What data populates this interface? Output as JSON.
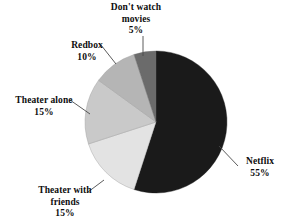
{
  "chart_data": {
    "type": "pie",
    "title": "",
    "subtitle": "",
    "xlabel": "",
    "ylabel": "",
    "legend_position": "none",
    "grid": false,
    "total": 100,
    "units": "%",
    "categories": [
      "Netflix",
      "Theater with friends",
      "Theater alone",
      "Redbox",
      "Don't watch movies"
    ],
    "values": [
      55,
      15,
      15,
      10,
      5
    ],
    "slices": [
      {
        "label": "Netflix",
        "value": 55,
        "value_text": "55%",
        "color": "#1a1a1a",
        "start_angle_deg": 0,
        "end_angle_deg": 198
      },
      {
        "label": "Theater with friends",
        "value": 15,
        "value_text": "15%",
        "color": "#e3e3e3",
        "start_angle_deg": 198,
        "end_angle_deg": 252
      },
      {
        "label": "Theater alone",
        "value": 15,
        "value_text": "15%",
        "color": "#c9c9c9",
        "start_angle_deg": 252,
        "end_angle_deg": 306
      },
      {
        "label": "Redbox",
        "value": 10,
        "value_text": "10%",
        "color": "#b5b5b5",
        "start_angle_deg": 306,
        "end_angle_deg": 342
      },
      {
        "label": "Don't watch movies",
        "value": 5,
        "value_text": "5%",
        "color": "#6b6b6b",
        "start_angle_deg": 342,
        "end_angle_deg": 360
      }
    ]
  },
  "labels": {
    "dont_watch": "Don't watch\nmovies\n5%",
    "redbox": "Redbox\n10%",
    "theater_alone": "Theater alone\n15%",
    "theater_friends": "Theater with\nfriends\n15%",
    "netflix": "Netflix\n55%"
  },
  "colors": {
    "background": "#ffffff",
    "text": "#0d0d0d",
    "leader_line": "#4a4a4a",
    "netflix": "#1a1a1a",
    "theater_friends": "#e3e3e3",
    "theater_alone": "#c9c9c9",
    "redbox": "#b5b5b5",
    "dont_watch": "#6b6b6b"
  }
}
